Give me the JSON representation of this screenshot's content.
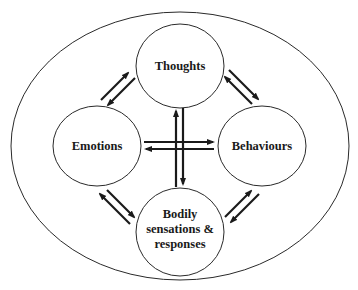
{
  "diagram": {
    "type": "cycle-with-cross",
    "outer_boundary": {
      "label": ""
    },
    "nodes": [
      {
        "id": "thoughts",
        "label_lines": [
          "Thoughts"
        ]
      },
      {
        "id": "emotions",
        "label_lines": [
          "Emotions"
        ]
      },
      {
        "id": "behaviours",
        "label_lines": [
          "Behaviours"
        ]
      },
      {
        "id": "bodily",
        "label_lines": [
          "Bodily",
          "sensations &",
          "responses"
        ]
      }
    ],
    "edges": [
      {
        "from": "thoughts",
        "to": "emotions",
        "bidirectional": true
      },
      {
        "from": "thoughts",
        "to": "behaviours",
        "bidirectional": true
      },
      {
        "from": "emotions",
        "to": "bodily",
        "bidirectional": true
      },
      {
        "from": "behaviours",
        "to": "bodily",
        "bidirectional": true
      },
      {
        "from": "thoughts",
        "to": "bodily",
        "bidirectional": true
      },
      {
        "from": "emotions",
        "to": "behaviours",
        "bidirectional": true
      }
    ],
    "colors": {
      "stroke": "#1a1a1a",
      "background": "#ffffff"
    }
  },
  "labels": {
    "thoughts": "Thoughts",
    "emotions": "Emotions",
    "behaviours": "Behaviours",
    "bodily_1": "Bodily",
    "bodily_2": "sensations &",
    "bodily_3": "responses"
  }
}
